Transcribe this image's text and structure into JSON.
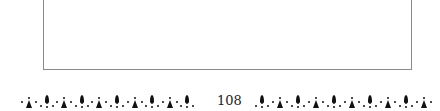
{
  "page": {
    "page_number": "108",
    "frame": {
      "border_color": "#8a8a8a",
      "content": ""
    },
    "footer": {
      "ornament_left_pattern": [
        "star",
        "drop",
        "star",
        "drop",
        "star",
        "drop",
        "star",
        "drop",
        "star",
        "drop"
      ],
      "ornament_right_pattern": [
        "drop",
        "star",
        "drop",
        "star",
        "drop",
        "star",
        "drop",
        "star",
        "drop",
        "star"
      ],
      "ornament_color": "#111111"
    }
  }
}
